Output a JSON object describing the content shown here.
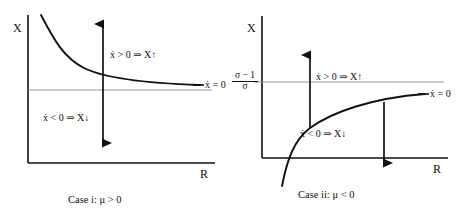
{
  "figure": {
    "type": "phase-diagram-pair",
    "background": "#ffffff",
    "ink_color": "#111111",
    "guide_color": "#8a8a8a"
  },
  "panels": [
    {
      "id": "case-i",
      "caption": "Case i: μ > 0",
      "y_axis_label": "X",
      "x_axis_label": "R",
      "nullcline_label": "ẋ = 0",
      "nullcline_shape": "decreasing convex (hyperbola-like), from upper-left to lower-right, asymptotic to a horizontal level",
      "upper_region_annotation": "ẋ > 0 ⇒ X↑",
      "lower_region_annotation": "ẋ < 0 ⇒ X↓",
      "upper_arrow_direction": "up",
      "lower_arrow_direction": "down",
      "horizontal_guide_label": "",
      "has_horizontal_guide": true
    },
    {
      "id": "case-ii",
      "caption": "Case ii: μ < 0",
      "y_axis_label": "X",
      "x_axis_label": "R",
      "nullcline_label": "ẋ = 0",
      "nullcline_shape": "increasing concave, rising from below the origin region toward an asymptote",
      "upper_region_annotation": "ẋ > 0 ⇒ X↑",
      "lower_region_annotation": "ẋ < 0 ⇒ X↓",
      "upper_arrow_direction": "up",
      "lower_arrow_direction": "down",
      "horizontal_guide_label": {
        "numerator": "σ − 1",
        "denominator": "σ"
      },
      "has_horizontal_guide": true
    }
  ]
}
